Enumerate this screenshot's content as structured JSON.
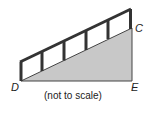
{
  "diagram": {
    "type": "ramp-with-railing",
    "points": {
      "D": {
        "label": "D"
      },
      "C": {
        "label": "C"
      },
      "E": {
        "label": "E"
      }
    },
    "caption": "(not to scale)",
    "colors": {
      "triangle_fill": "#c8c8c8",
      "rail": "#333333",
      "background": "#ffffff"
    },
    "railing_posts": 6
  }
}
